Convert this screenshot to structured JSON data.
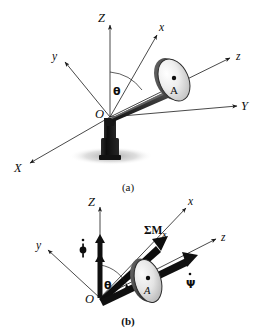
{
  "figure": {
    "title_visible": false,
    "background_color": "#ffffff",
    "line_color": "#1a1a1a",
    "disk_fill_light": "#f2f2f2",
    "disk_fill_dark": "#a8a8a8",
    "post_color": "#1c1c1c",
    "shadow_color": "#b9b9b9"
  },
  "panel_a": {
    "caption": "(a)",
    "axes": [
      {
        "name": "Z-axis",
        "label": "Z"
      },
      {
        "name": "Y-axis",
        "label": "Y"
      },
      {
        "name": "X-axis",
        "label": "X"
      },
      {
        "name": "x-axis",
        "label": "x"
      },
      {
        "name": "y-axis",
        "label": "y"
      },
      {
        "name": "z-axis",
        "label": "z"
      }
    ],
    "origin_label": "O",
    "angle_label": "θ",
    "disk_point_label": "A"
  },
  "panel_b": {
    "caption": "(b)",
    "axes": [
      {
        "name": "Z-axis",
        "label": "Z"
      },
      {
        "name": "x-axis",
        "label": "x"
      },
      {
        "name": "y-axis",
        "label": "y"
      },
      {
        "name": "z-axis",
        "label": "z"
      }
    ],
    "origin_label": "O",
    "angle_label": "θ",
    "disk_point_label": "A",
    "moment_label": "ΣM",
    "moment_subscript": "x",
    "phi_dot_label": "φ",
    "psi_dot_label": "Ψ"
  }
}
